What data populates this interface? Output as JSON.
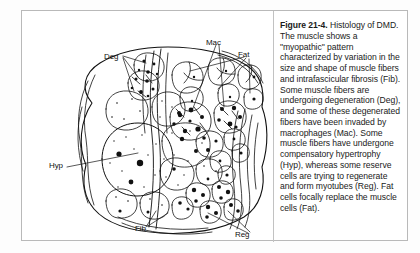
{
  "figure": {
    "caption_title": "Figure 21-4.",
    "caption_body": " Histology of DMD. The muscle shows a \"myopathic\" pattern characterized by variation in the size and shape of muscle fibers and intrafascicular fibrosis (Fib). Some muscle fibers are undergoing degeneration (Deg), and some of these degenerated fibers have been invaded by macrophages (Mac). Some muscle fibers have undergone compensatory hypertrophy (Hyp), whereas some reserve cells are trying to regenerate and form myotubes (Reg). Fat cells focally replace the muscle cells (Fat)."
  },
  "diagram": {
    "type": "histology-illustration",
    "labels": [
      {
        "id": "deg",
        "text": "Deg",
        "x": 82,
        "y": 41,
        "meaning": "degenerating muscle fibers"
      },
      {
        "id": "mac",
        "text": "Mac",
        "x": 184,
        "y": 27,
        "meaning": "macrophages"
      },
      {
        "id": "fat",
        "text": "Fat",
        "x": 216,
        "y": 39,
        "meaning": "fat cells"
      },
      {
        "id": "hyp",
        "text": "Hyp",
        "x": 27,
        "y": 150,
        "meaning": "compensatory hypertrophy"
      },
      {
        "id": "fib",
        "text": "Fib",
        "x": 113,
        "y": 213,
        "meaning": "intrafascicular fibrosis"
      },
      {
        "id": "reg",
        "text": "Reg",
        "x": 213,
        "y": 219,
        "meaning": "regenerating myotubes"
      }
    ],
    "colors": {
      "ink": "#111111",
      "paper": "#ffffff",
      "rule": "#b9b9b9"
    }
  }
}
